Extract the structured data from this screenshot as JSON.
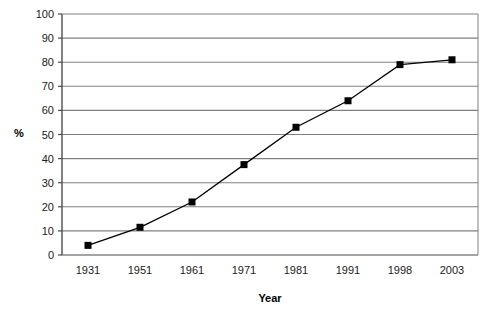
{
  "chart_data": {
    "type": "line",
    "title": "",
    "xlabel": "Year",
    "ylabel": "%",
    "categories": [
      "1931",
      "1951",
      "1961",
      "1971",
      "1981",
      "1991",
      "1998",
      "2003"
    ],
    "values": [
      4,
      11.5,
      22,
      37.5,
      53,
      64,
      79,
      81
    ],
    "series": [
      {
        "name": "",
        "values": [
          4,
          11.5,
          22,
          37.5,
          53,
          64,
          79,
          81
        ]
      }
    ],
    "ylim": [
      0,
      100
    ],
    "ytick_step": 10,
    "yticks": [
      "0",
      "10",
      "20",
      "30",
      "40",
      "50",
      "60",
      "70",
      "80",
      "90",
      "100"
    ],
    "grid": "horizontal",
    "legend": "none",
    "marker": "square",
    "colors": {
      "line": "#000000",
      "marker": "#000000",
      "gridline": "#808080",
      "axis": "#4d4d4d",
      "text": "#1a1a1a",
      "background": "#ffffff"
    }
  }
}
